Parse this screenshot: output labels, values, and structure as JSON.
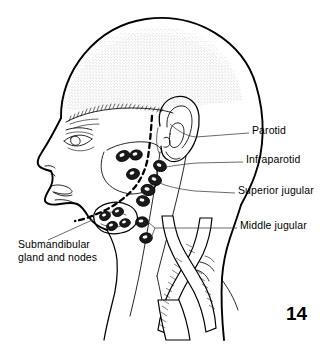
{
  "figure": {
    "number": "14",
    "background_color": "#ffffff",
    "ink_color": "#000000",
    "stipple_color": "#9a9a9a",
    "leader_color": "#3a3a3a",
    "width": 328,
    "height": 346
  },
  "labels": {
    "parotid": "Parotid",
    "infraparotid": "Infraparotid",
    "superior_jugular": "Superior jugular",
    "middle_jugular": "Middle jugular",
    "submandibular_line1": "Submandibular",
    "submandibular_line2": "gland and nodes"
  },
  "label_list": [
    {
      "id": "parotid",
      "text": "Parotid",
      "x": 252,
      "y": 128,
      "side": "right"
    },
    {
      "id": "infraparotid",
      "text": "Infraparotid",
      "x": 246,
      "y": 158,
      "side": "right"
    },
    {
      "id": "superior-jugular",
      "text": "Superior jugular",
      "x": 238,
      "y": 189,
      "side": "right"
    },
    {
      "id": "middle-jugular",
      "text": "Middle jugular",
      "x": 240,
      "y": 224,
      "side": "right"
    },
    {
      "id": "submandibular",
      "text": "Submandibular gland and nodes",
      "x": 18,
      "y": 243,
      "side": "left"
    }
  ],
  "anatomy_parts": [
    "skull-outline",
    "face-profile",
    "hairline",
    "stippled-scalp",
    "eye",
    "ear",
    "mandible-dashed-border",
    "neck-outline",
    "sternocleidomastoid",
    "submandibular-gland",
    "lymph-node-chain",
    "carotid-vessels"
  ]
}
